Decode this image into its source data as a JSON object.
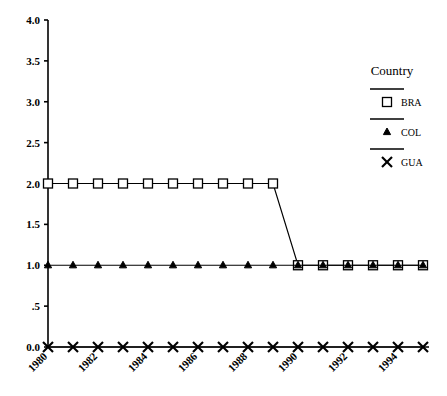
{
  "chart_data": {
    "type": "line",
    "title": "",
    "xlabel": "",
    "ylabel": "",
    "ylim": [
      0.0,
      4.0
    ],
    "yticks": [
      0.0,
      0.5,
      1.0,
      1.5,
      2.0,
      2.5,
      3.0,
      3.5,
      4.0
    ],
    "ytick_labels": [
      "0.0",
      ".5",
      "1.0",
      "1.5",
      "2.0",
      "2.5",
      "3.0",
      "3.5",
      "4.0"
    ],
    "x": [
      1980,
      1981,
      1982,
      1983,
      1984,
      1985,
      1986,
      1987,
      1988,
      1989,
      1990,
      1991,
      1992,
      1993,
      1994,
      1995
    ],
    "xtick_labels": [
      "1980",
      "",
      "1982",
      "",
      "1984",
      "",
      "1986",
      "",
      "1988",
      "",
      "1990",
      "",
      "1992",
      "",
      "1994",
      ""
    ],
    "xtick_label_rotation": 45,
    "grid": false,
    "legend_position": "top-right",
    "series": [
      {
        "name": "BRA",
        "marker": "square",
        "values": [
          2,
          2,
          2,
          2,
          2,
          2,
          2,
          2,
          2,
          2,
          1,
          1,
          1,
          1,
          1,
          1
        ]
      },
      {
        "name": "COL",
        "marker": "triangle",
        "values": [
          1,
          1,
          1,
          1,
          1,
          1,
          1,
          1,
          1,
          1,
          1,
          1,
          1,
          1,
          1,
          1
        ]
      },
      {
        "name": "GUA",
        "marker": "x",
        "values": [
          0,
          0,
          0,
          0,
          0,
          0,
          0,
          0,
          0,
          0,
          0,
          0,
          0,
          0,
          0,
          0
        ]
      }
    ]
  },
  "legend": {
    "title": "Country",
    "entries": [
      {
        "label": "BRA",
        "marker": "square"
      },
      {
        "label": "COL",
        "marker": "triangle"
      },
      {
        "label": "GUA",
        "marker": "x"
      }
    ]
  },
  "colors": {
    "ink": "#000000",
    "background": "#ffffff"
  }
}
